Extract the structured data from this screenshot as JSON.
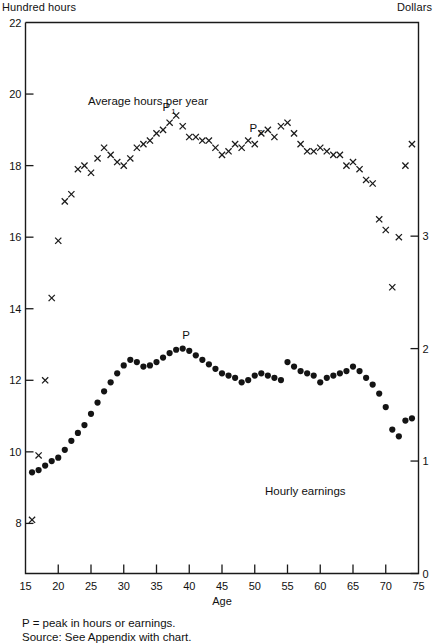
{
  "header": {
    "left_label": "Hundred hours",
    "right_label": "Dollars"
  },
  "footnotes": {
    "peak_note": "P = peak in hours or earnings.",
    "source_note": "Source:  See Appendix  with  chart."
  },
  "axes": {
    "x": {
      "label": "Age",
      "ticks": [
        15,
        20,
        25,
        30,
        35,
        40,
        45,
        50,
        55,
        60,
        65,
        70,
        75
      ],
      "min": 15,
      "max": 75
    },
    "y_left": {
      "label": "Hundred hours",
      "ticks": [
        22,
        20,
        18,
        16,
        14,
        12,
        10,
        8
      ],
      "min": 6.6,
      "max": 22
    },
    "y_right": {
      "label": "Dollars",
      "ticks": [
        3,
        2,
        1,
        0
      ],
      "min": 0,
      "max": 4.9
    }
  },
  "annotations": [
    {
      "name": "peak-p1",
      "text": "P",
      "sub": "1",
      "x": 36.5,
      "series": "hours"
    },
    {
      "name": "peak-p2",
      "text": "P",
      "sub": "2",
      "x": 49.8,
      "series": "hours"
    },
    {
      "name": "peak-p-earnings",
      "text": "P",
      "sub": "",
      "x": 39.5,
      "series": "earnings"
    }
  ],
  "series_labels": {
    "hours": "Average hours per year",
    "earnings": "Hourly earnings"
  },
  "chart_data": {
    "type": "scatter",
    "title": "",
    "subtitle": "",
    "xlabel": "Age",
    "ylabel": "Hundred hours",
    "y2label": "Dollars",
    "xlim": [
      15,
      75
    ],
    "ylim": [
      6.6,
      22
    ],
    "y2lim": [
      0,
      4.9
    ],
    "grid": false,
    "legend": "inline-annotation",
    "series": [
      {
        "name": "Average hours per year",
        "axis": "left",
        "marker": "x",
        "units": "hundred hours",
        "x": [
          16,
          17,
          18,
          19,
          20,
          21,
          22,
          23,
          24,
          25,
          26,
          27,
          28,
          29,
          30,
          31,
          32,
          33,
          34,
          35,
          36,
          37,
          38,
          39,
          40,
          41,
          42,
          43,
          44,
          45,
          46,
          47,
          48,
          49,
          50,
          51,
          52,
          53,
          54,
          55,
          56,
          57,
          58,
          59,
          60,
          61,
          62,
          63,
          64,
          65,
          66,
          67,
          68,
          69,
          70,
          71,
          72,
          73,
          74
        ],
        "values": [
          8.1,
          9.9,
          12.0,
          14.3,
          15.9,
          17.0,
          17.2,
          17.9,
          18.0,
          17.8,
          18.2,
          18.5,
          18.3,
          18.1,
          18.0,
          18.2,
          18.5,
          18.6,
          18.7,
          18.9,
          19.0,
          19.2,
          19.4,
          19.1,
          18.8,
          18.8,
          18.7,
          18.7,
          18.5,
          18.3,
          18.4,
          18.6,
          18.5,
          18.7,
          18.6,
          18.9,
          19.0,
          18.8,
          19.1,
          19.2,
          18.9,
          18.6,
          18.4,
          18.4,
          18.5,
          18.4,
          18.3,
          18.3,
          18.0,
          18.1,
          17.9,
          17.6,
          17.5,
          16.5,
          16.2,
          14.6,
          16.0,
          18.0,
          18.6
        ]
      },
      {
        "name": "Hourly earnings",
        "axis": "right",
        "marker": "dot",
        "units": "dollars",
        "x": [
          16,
          17,
          18,
          19,
          20,
          21,
          22,
          23,
          24,
          25,
          26,
          27,
          28,
          29,
          30,
          31,
          32,
          33,
          34,
          35,
          36,
          37,
          38,
          39,
          40,
          41,
          42,
          43,
          44,
          45,
          46,
          47,
          48,
          49,
          50,
          51,
          52,
          53,
          54,
          55,
          56,
          57,
          58,
          59,
          60,
          61,
          62,
          63,
          64,
          65,
          66,
          67,
          68,
          69,
          70,
          71,
          72,
          73,
          74
        ],
        "values": [
          0.9,
          0.92,
          0.96,
          1.0,
          1.03,
          1.1,
          1.18,
          1.25,
          1.32,
          1.42,
          1.52,
          1.62,
          1.7,
          1.78,
          1.85,
          1.9,
          1.88,
          1.84,
          1.85,
          1.88,
          1.92,
          1.96,
          1.99,
          2.0,
          1.98,
          1.94,
          1.9,
          1.86,
          1.82,
          1.78,
          1.76,
          1.74,
          1.7,
          1.72,
          1.76,
          1.78,
          1.76,
          1.74,
          1.72,
          1.88,
          1.84,
          1.8,
          1.78,
          1.76,
          1.7,
          1.74,
          1.76,
          1.78,
          1.8,
          1.84,
          1.8,
          1.74,
          1.68,
          1.6,
          1.48,
          1.28,
          1.22,
          1.36,
          1.38
        ]
      }
    ]
  }
}
